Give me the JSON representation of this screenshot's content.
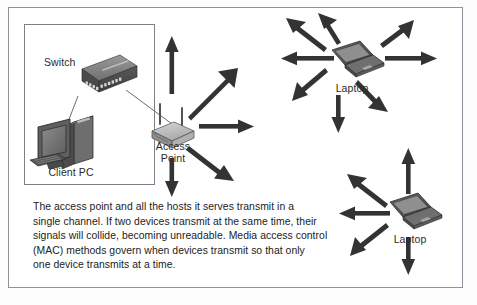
{
  "figure": {
    "background_color": "#ffffff",
    "frame_color": "#8d9199",
    "ink_color": "#3a3a3a"
  },
  "labels": {
    "switch": "Switch",
    "client_pc": "Client PC",
    "access_point": "Access\nPoint",
    "access_point_line1": "Access",
    "access_point_line2": "Point",
    "laptop_top": "Laptop",
    "laptop_bottom": "Laptop"
  },
  "caption": {
    "text": "The access point and all the hosts it serves transmit in a single channel. If two devices transmit at the same time, their signals will collide, becoming unreadable. Media access control (MAC) methods govern when devices transmit so that only one device transmits at a time.",
    "lines": [
      "The access point and all the hosts it serves transmit in a",
      "single channel. If two devices transmit at the same time, their",
      "signals will collide, becoming unreadable. Media access control",
      "(MAC) methods govern when devices transmit so that only",
      "one device transmits at a time."
    ]
  },
  "devices": [
    {
      "id": "switch",
      "label": "Switch",
      "type": "network-switch"
    },
    {
      "id": "client-pc",
      "label": "Client PC",
      "type": "desktop-computer"
    },
    {
      "id": "access-point",
      "label": "Access Point",
      "type": "wireless-access-point",
      "antennas": 2
    },
    {
      "id": "laptop-top",
      "label": "Laptop",
      "type": "laptop"
    },
    {
      "id": "laptop-bottom",
      "label": "Laptop",
      "type": "laptop"
    }
  ],
  "connections": [
    {
      "from": "client-pc",
      "to": "switch",
      "style": "wired"
    },
    {
      "from": "switch",
      "to": "access-point",
      "style": "wired"
    }
  ],
  "radiation": {
    "access_point_directions": [
      "up",
      "up-right",
      "right",
      "down-right",
      "down"
    ],
    "laptop_top_directions": [
      "up",
      "up-left",
      "left",
      "down-left",
      "down",
      "down-right",
      "right",
      "up-right"
    ],
    "laptop_bottom_directions": [
      "up",
      "up-left",
      "left",
      "down-left",
      "down"
    ]
  }
}
